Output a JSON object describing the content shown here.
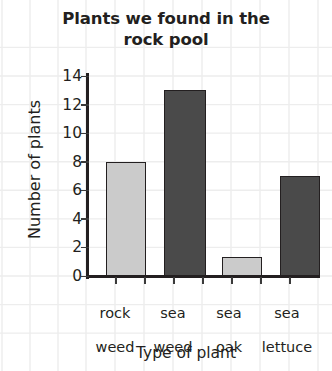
{
  "chart_data": {
    "type": "bar",
    "title": "Plants we found in the rock pool",
    "title_line1": "Plants we found in the",
    "title_line2": "rock pool",
    "xlabel": "Type of plant",
    "ylabel": "Number of plants",
    "categories": [
      "rock weed",
      "sea weed",
      "sea oak",
      "sea lettuce"
    ],
    "category_lines": [
      [
        "rock",
        "weed"
      ],
      [
        "sea",
        "weed"
      ],
      [
        "sea",
        "oak"
      ],
      [
        "sea",
        "lettuce"
      ]
    ],
    "values": [
      8,
      13,
      1.3,
      7
    ],
    "bar_colors": [
      "#cbcbcb",
      "#4a4a4a",
      "#cbcbcb",
      "#4a4a4a"
    ],
    "bar_edge_color": "#231f20",
    "ylim": [
      0,
      14
    ],
    "ytick_values": [
      0,
      2,
      4,
      6,
      8,
      10,
      12,
      14
    ],
    "ytick_labels": [
      "0",
      "2",
      "4",
      "6",
      "8",
      "10",
      "12",
      "14"
    ],
    "grid": true,
    "grid_color": "#ebebeb",
    "legend": "none",
    "background": "#ffffff"
  }
}
